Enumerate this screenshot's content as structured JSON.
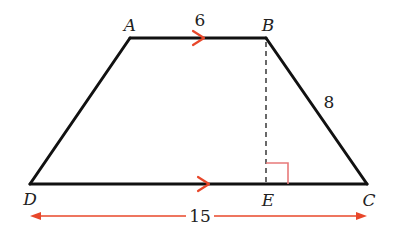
{
  "diagram": {
    "type": "trapezoid",
    "vertices": {
      "A": "A",
      "B": "B",
      "C": "C",
      "D": "D",
      "E": "E"
    },
    "measurements": {
      "AB": "6",
      "BC": "8",
      "DC": "15"
    },
    "annotations": {
      "parallel_marks": [
        "AB",
        "DC"
      ],
      "altitude": "BE",
      "right_angle_at": "E"
    },
    "colors": {
      "outline": "#111111",
      "accent": "#e8472a",
      "right_angle": "#e87a7a",
      "dashed": "#444444",
      "text": "#222222"
    }
  }
}
